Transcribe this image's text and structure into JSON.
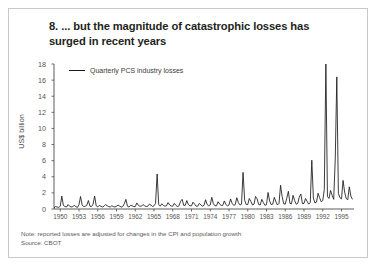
{
  "figure": {
    "number": "8.",
    "title": "8. ... but the magnitude of catastrophic losses has surged in recent years",
    "note": "Note: reported losses are adjusted for changes in the CPI and population growth",
    "source": "Source: CBOT",
    "frame_color": "#c9c9c9",
    "line_color": "#1a1a1a",
    "text_color": "#231f20"
  },
  "chart_data": {
    "type": "line",
    "title": "8. ... but the magnitude of catastrophic losses has surged in recent years",
    "xlabel": "",
    "ylabel": "US$ billion",
    "legend": [
      {
        "name": "Quarterly PCS industry losses",
        "color": "#1a1a1a"
      }
    ],
    "legend_position": "top-left-inside",
    "grid": false,
    "xlim": [
      1949.0,
      1997.0
    ],
    "ylim": [
      0,
      18
    ],
    "yticks": [
      0,
      2,
      4,
      6,
      8,
      10,
      12,
      14,
      16,
      18
    ],
    "ytick_labels": [
      "0",
      "2",
      "4",
      "6",
      "8",
      "10",
      "12",
      "14",
      "16",
      "18"
    ],
    "xticks": [
      1950,
      1953,
      1956,
      1959,
      1962,
      1965,
      1968,
      1971,
      1974,
      1977,
      1980,
      1983,
      1986,
      1989,
      1992,
      1995
    ],
    "xtick_labels": [
      "1950",
      "1953",
      "1956",
      "1959",
      "1962",
      "1965",
      "1968",
      "1971",
      "1974",
      "1977",
      "1980",
      "1983",
      "1986",
      "1989",
      "1992",
      "1995"
    ],
    "series": [
      {
        "name": "Quarterly PCS industry losses",
        "x": [
          1949.0,
          1949.25,
          1949.5,
          1949.75,
          1950.0,
          1950.25,
          1950.5,
          1950.75,
          1951.0,
          1951.25,
          1951.5,
          1951.75,
          1952.0,
          1952.25,
          1952.5,
          1952.75,
          1953.0,
          1953.25,
          1953.5,
          1953.75,
          1954.0,
          1954.25,
          1954.5,
          1954.75,
          1955.0,
          1955.25,
          1955.5,
          1955.75,
          1956.0,
          1956.25,
          1956.5,
          1956.75,
          1957.0,
          1957.25,
          1957.5,
          1957.75,
          1958.0,
          1958.25,
          1958.5,
          1958.75,
          1959.0,
          1959.25,
          1959.5,
          1959.75,
          1960.0,
          1960.25,
          1960.5,
          1960.75,
          1961.0,
          1961.25,
          1961.5,
          1961.75,
          1962.0,
          1962.25,
          1962.5,
          1962.75,
          1963.0,
          1963.25,
          1963.5,
          1963.75,
          1964.0,
          1964.25,
          1964.5,
          1964.75,
          1965.0,
          1965.25,
          1965.5,
          1965.75,
          1966.0,
          1966.25,
          1966.5,
          1966.75,
          1967.0,
          1967.25,
          1967.5,
          1967.75,
          1968.0,
          1968.25,
          1968.5,
          1968.75,
          1969.0,
          1969.25,
          1969.5,
          1969.75,
          1970.0,
          1970.25,
          1970.5,
          1970.75,
          1971.0,
          1971.25,
          1971.5,
          1971.75,
          1972.0,
          1972.25,
          1972.5,
          1972.75,
          1973.0,
          1973.25,
          1973.5,
          1973.75,
          1974.0,
          1974.25,
          1974.5,
          1974.75,
          1975.0,
          1975.25,
          1975.5,
          1975.75,
          1976.0,
          1976.25,
          1976.5,
          1976.75,
          1977.0,
          1977.25,
          1977.5,
          1977.75,
          1978.0,
          1978.25,
          1978.5,
          1978.75,
          1979.0,
          1979.25,
          1979.5,
          1979.75,
          1980.0,
          1980.25,
          1980.5,
          1980.75,
          1981.0,
          1981.25,
          1981.5,
          1981.75,
          1982.0,
          1982.25,
          1982.5,
          1982.75,
          1983.0,
          1983.25,
          1983.5,
          1983.75,
          1984.0,
          1984.25,
          1984.5,
          1984.75,
          1985.0,
          1985.25,
          1985.5,
          1985.75,
          1986.0,
          1986.25,
          1986.5,
          1986.75,
          1987.0,
          1987.25,
          1987.5,
          1987.75,
          1988.0,
          1988.25,
          1988.5,
          1988.75,
          1989.0,
          1989.25,
          1989.5,
          1989.75,
          1990.0,
          1990.25,
          1990.5,
          1990.75,
          1991.0,
          1991.25,
          1991.5,
          1991.75,
          1992.0,
          1992.25,
          1992.5,
          1992.75,
          1993.0,
          1993.25,
          1993.5,
          1993.75,
          1994.0,
          1994.25,
          1994.5,
          1994.75,
          1995.0,
          1995.25,
          1995.5,
          1995.75,
          1996.0,
          1996.25,
          1996.5,
          1996.75
        ],
        "values": [
          0.15,
          0.3,
          0.25,
          0.2,
          0.35,
          1.6,
          0.45,
          0.3,
          0.25,
          0.55,
          0.35,
          0.25,
          0.3,
          0.45,
          0.3,
          0.2,
          0.55,
          1.55,
          0.5,
          0.3,
          0.35,
          0.45,
          1.05,
          0.35,
          0.3,
          0.6,
          1.6,
          0.4,
          0.25,
          0.45,
          0.35,
          0.25,
          0.35,
          0.55,
          0.4,
          0.3,
          0.25,
          0.4,
          0.3,
          0.25,
          0.35,
          0.5,
          0.35,
          0.25,
          0.3,
          0.65,
          1.2,
          0.35,
          0.25,
          0.45,
          0.4,
          0.3,
          0.3,
          0.75,
          0.45,
          0.35,
          0.35,
          0.55,
          0.4,
          0.3,
          0.35,
          0.6,
          0.5,
          0.3,
          0.4,
          0.7,
          4.35,
          0.55,
          0.35,
          0.65,
          0.45,
          0.35,
          0.4,
          0.8,
          0.5,
          0.35,
          0.35,
          0.7,
          0.45,
          0.3,
          0.4,
          0.95,
          1.2,
          0.45,
          0.45,
          1.05,
          0.55,
          0.4,
          0.4,
          0.85,
          0.6,
          0.35,
          0.35,
          0.7,
          0.5,
          0.35,
          0.45,
          1.15,
          0.55,
          0.4,
          0.5,
          1.45,
          0.65,
          0.4,
          0.4,
          0.9,
          0.6,
          0.45,
          0.45,
          1.0,
          0.55,
          0.4,
          0.5,
          1.25,
          0.7,
          0.45,
          0.55,
          1.4,
          0.8,
          0.5,
          0.6,
          4.55,
          1.1,
          0.55,
          0.55,
          1.3,
          0.95,
          0.5,
          0.6,
          1.55,
          1.25,
          0.55,
          0.5,
          1.2,
          0.8,
          0.45,
          0.55,
          2.05,
          1.0,
          0.55,
          0.6,
          1.45,
          0.9,
          0.5,
          0.7,
          2.95,
          1.55,
          0.65,
          0.6,
          1.35,
          2.2,
          0.7,
          0.65,
          1.7,
          1.05,
          0.6,
          0.7,
          1.5,
          1.85,
          0.65,
          0.7,
          1.3,
          0.95,
          0.6,
          0.8,
          6.05,
          1.35,
          0.75,
          0.85,
          1.95,
          1.4,
          0.9,
          1.05,
          2.4,
          18.1,
          1.55,
          1.3,
          2.3,
          1.7,
          1.2,
          6.2,
          16.4,
          1.95,
          1.4,
          1.25,
          3.55,
          2.1,
          1.3,
          1.15,
          2.75,
          1.6,
          1.2
        ]
      }
    ],
    "peaks": [
      {
        "year": 1965.5,
        "value": 4.35,
        "label": "Hurricane Betsy"
      },
      {
        "year": 1979.25,
        "value": 4.55,
        "label": "Hurricane Frederic"
      },
      {
        "year": 1989.25,
        "value": 6.05,
        "label": "Hurricane Hugo"
      },
      {
        "year": 1992.5,
        "value": 18.1,
        "label": "Hurricane Andrew"
      },
      {
        "year": 1994.25,
        "value": 16.4,
        "label": "Northridge earthquake"
      }
    ]
  }
}
